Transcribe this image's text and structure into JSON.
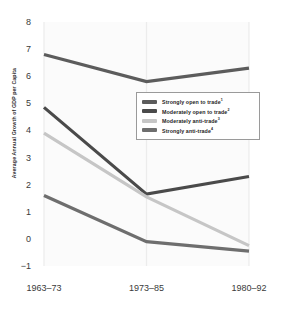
{
  "chart_data": {
    "type": "line",
    "title": "",
    "xlabel": "",
    "ylabel": "Average Annual Growth of GDP per Capita",
    "categories": [
      "1963–73",
      "1973–85",
      "1980–92"
    ],
    "ylim": [
      -1,
      8
    ],
    "yticks": [
      8,
      7,
      6,
      5,
      4,
      3,
      2,
      1,
      0,
      -1
    ],
    "ytick_labels": [
      "8",
      "7",
      "6",
      "5",
      "4",
      "3",
      "2",
      "1",
      "0",
      "−1"
    ],
    "grid": "vertical-only",
    "legend_position": "center",
    "series": [
      {
        "name": "Strongly open to trade",
        "footnote": "1",
        "color": "#5c5c5c",
        "values": [
          6.8,
          5.8,
          6.3
        ]
      },
      {
        "name": "Moderately open to trade",
        "footnote": "2",
        "color": "#4a4a4a",
        "values": [
          4.85,
          1.65,
          2.3
        ]
      },
      {
        "name": "Moderately anti-trade",
        "footnote": "3",
        "color": "#c6c6c6",
        "values": [
          3.9,
          1.55,
          -0.25
        ]
      },
      {
        "name": "Strongly anti-trade",
        "footnote": "4",
        "color": "#6e6e6e",
        "values": [
          1.6,
          -0.1,
          -0.45
        ]
      }
    ]
  }
}
